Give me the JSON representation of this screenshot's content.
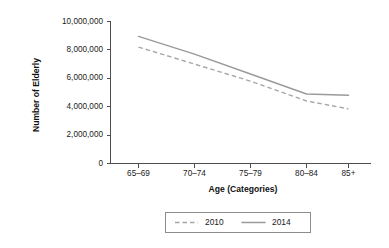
{
  "chart_data": {
    "type": "line",
    "title": "",
    "subtitle": "",
    "xlabel": "Age (Categories)",
    "ylabel": "Number of Elderly",
    "categories": [
      "65–69",
      "70–74",
      "75–79",
      "80–84",
      "85+"
    ],
    "series": [
      {
        "name": "2010",
        "style": "dashed",
        "color": "#a6a6a6",
        "values": [
          8200000,
          7000000,
          5800000,
          4400000,
          3850000
        ]
      },
      {
        "name": "2014",
        "style": "solid",
        "color": "#9a9a9a",
        "values": [
          8950000,
          7700000,
          6300000,
          4900000,
          4800000
        ]
      }
    ],
    "ylim": [
      0,
      10000000
    ],
    "yticks": [
      0,
      2000000,
      4000000,
      6000000,
      8000000,
      10000000
    ],
    "ytick_labels": [
      "0",
      "2,000,000",
      "4,000,000",
      "6,000,000",
      "8,000,000",
      "10,000,000"
    ],
    "grid": false,
    "legend_position": "bottom",
    "legend_entries": [
      {
        "label": "2010",
        "style": "dashed"
      },
      {
        "label": "2014",
        "style": "solid"
      }
    ],
    "background_color": "#ffffff",
    "axis_color": "#4d4d4d"
  },
  "axes": {
    "y_title": "Number of Elderly",
    "x_title": "Age (Categories)"
  },
  "y_ticks": {
    "t0": "0",
    "t1": "2,000,000",
    "t2": "4,000,000",
    "t3": "6,000,000",
    "t4": "8,000,000",
    "t5": "10,000,000"
  },
  "x_ticks": {
    "c0": "65–69",
    "c1": "70–74",
    "c2": "75–79",
    "c3": "80–84",
    "c4": "85+"
  },
  "legend": {
    "entry0": "2010",
    "entry1": "2014"
  }
}
